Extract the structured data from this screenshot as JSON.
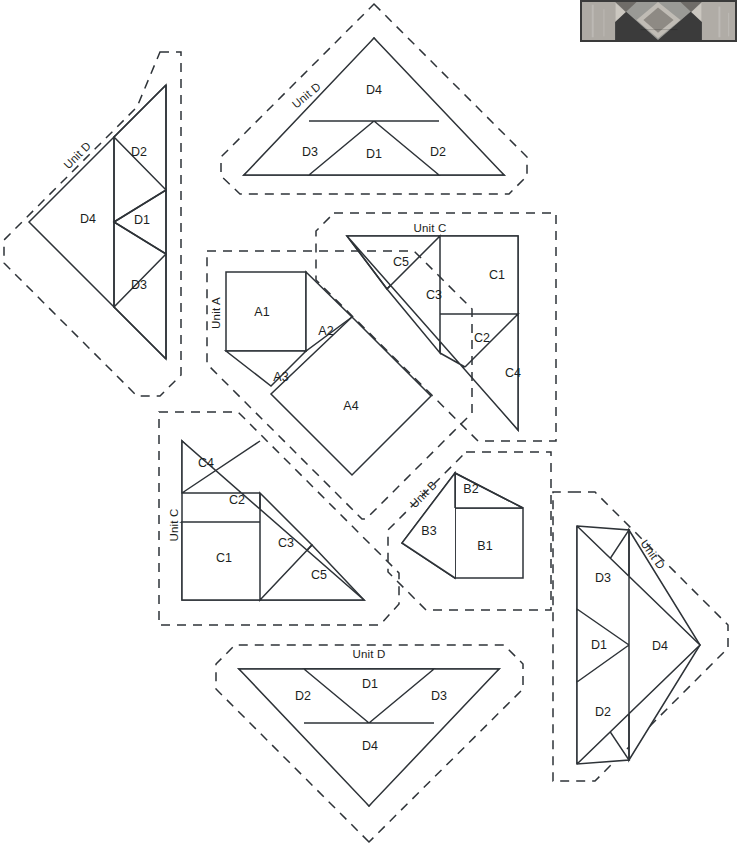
{
  "document": {
    "kind": "quilt-block-cutting-diagram",
    "background_color": "#ffffff",
    "line_color": "#2e3338",
    "cutline_style": "dashed"
  },
  "photo": {
    "alt_name": "finished-block-photograph",
    "caption": ""
  },
  "units": [
    {
      "id": "unit-d-left",
      "label": "Unit D",
      "orientation": "points-left",
      "pieces": [
        {
          "id": "D4",
          "label": "D4",
          "shape": "triangle",
          "x": 88,
          "y": 220
        },
        {
          "id": "D2",
          "label": "D2",
          "shape": "triangle",
          "x": 137,
          "y": 153
        },
        {
          "id": "D1",
          "label": "D1",
          "shape": "triangle",
          "x": 142,
          "y": 220
        },
        {
          "id": "D3",
          "label": "D3",
          "shape": "triangle",
          "x": 137,
          "y": 285
        }
      ]
    },
    {
      "id": "unit-d-top",
      "label": "Unit D",
      "orientation": "points-up",
      "pieces": [
        {
          "id": "D4",
          "label": "D4",
          "shape": "triangle",
          "x": 374,
          "y": 90
        },
        {
          "id": "D3",
          "label": "D3",
          "shape": "triangle",
          "x": 311,
          "y": 152
        },
        {
          "id": "D1",
          "label": "D1",
          "shape": "triangle",
          "x": 374,
          "y": 154
        },
        {
          "id": "D2",
          "label": "D2",
          "shape": "triangle",
          "x": 438,
          "y": 152
        }
      ]
    },
    {
      "id": "unit-c-top",
      "label": "Unit C",
      "orientation": "upper-right",
      "pieces": [
        {
          "id": "C5",
          "label": "C5",
          "shape": "triangle",
          "x": 401,
          "y": 263
        },
        {
          "id": "C3",
          "label": "C3",
          "shape": "triangle",
          "x": 434,
          "y": 296
        },
        {
          "id": "C1",
          "label": "C1",
          "shape": "square",
          "x": 497,
          "y": 275
        },
        {
          "id": "C2",
          "label": "C2",
          "shape": "triangle",
          "x": 482,
          "y": 338
        },
        {
          "id": "C4",
          "label": "C4",
          "shape": "triangle",
          "x": 513,
          "y": 373
        }
      ]
    },
    {
      "id": "unit-a",
      "label": "Unit A",
      "orientation": "center",
      "pieces": [
        {
          "id": "A1",
          "label": "A1",
          "shape": "square",
          "x": 262,
          "y": 313
        },
        {
          "id": "A2",
          "label": "A2",
          "shape": "triangle",
          "x": 325,
          "y": 332
        },
        {
          "id": "A3",
          "label": "A3",
          "shape": "triangle",
          "x": 281,
          "y": 377
        },
        {
          "id": "A4",
          "label": "A4",
          "shape": "square",
          "x": 351,
          "y": 406
        }
      ]
    },
    {
      "id": "unit-c-bottom",
      "label": "Unit C",
      "orientation": "lower-left",
      "pieces": [
        {
          "id": "C4",
          "label": "C4",
          "shape": "triangle",
          "x": 205,
          "y": 463
        },
        {
          "id": "C2",
          "label": "C2",
          "shape": "triangle",
          "x": 236,
          "y": 500
        },
        {
          "id": "C1",
          "label": "C1",
          "shape": "square",
          "x": 224,
          "y": 558
        },
        {
          "id": "C3",
          "label": "C3",
          "shape": "triangle",
          "x": 285,
          "y": 543
        },
        {
          "id": "C5",
          "label": "C5",
          "shape": "triangle",
          "x": 318,
          "y": 575
        }
      ]
    },
    {
      "id": "unit-b",
      "label": "Unit B",
      "orientation": "points-left",
      "pieces": [
        {
          "id": "B2",
          "label": "B2",
          "shape": "triangle",
          "x": 470,
          "y": 489
        },
        {
          "id": "B3",
          "label": "B3",
          "shape": "triangle",
          "x": 428,
          "y": 531
        },
        {
          "id": "B1",
          "label": "B1",
          "shape": "square",
          "x": 484,
          "y": 546
        }
      ]
    },
    {
      "id": "unit-d-bottom",
      "label": "Unit D",
      "orientation": "points-down",
      "pieces": [
        {
          "id": "D1",
          "label": "D1",
          "shape": "triangle",
          "x": 370,
          "y": 684
        },
        {
          "id": "D2",
          "label": "D2",
          "shape": "triangle",
          "x": 302,
          "y": 696
        },
        {
          "id": "D3",
          "label": "D3",
          "shape": "triangle",
          "x": 438,
          "y": 696
        },
        {
          "id": "D4",
          "label": "D4",
          "shape": "triangle",
          "x": 370,
          "y": 746
        }
      ]
    },
    {
      "id": "unit-d-right",
      "label": "Unit D",
      "orientation": "points-right",
      "pieces": [
        {
          "id": "D3",
          "label": "D3",
          "shape": "triangle",
          "x": 602,
          "y": 578
        },
        {
          "id": "D1",
          "label": "D1",
          "shape": "triangle",
          "x": 598,
          "y": 645
        },
        {
          "id": "D4",
          "label": "D4",
          "shape": "triangle",
          "x": 659,
          "y": 646
        },
        {
          "id": "D2",
          "label": "D2",
          "shape": "triangle",
          "x": 602,
          "y": 712
        }
      ]
    }
  ],
  "unit_labels": [
    {
      "id": "unit-d-left-label",
      "text": "Unit D",
      "x": 78,
      "y": 156,
      "rotate": -45
    },
    {
      "id": "unit-d-top-label",
      "text": "Unit D",
      "x": 307,
      "y": 95,
      "rotate": -38
    },
    {
      "id": "unit-c-top-label",
      "text": "Unit C",
      "x": 430,
      "y": 229,
      "rotate": 0
    },
    {
      "id": "unit-a-label",
      "text": "Unit A",
      "x": 216,
      "y": 313,
      "rotate": -90
    },
    {
      "id": "unit-c-bottom-label",
      "text": "Unit C",
      "x": 174,
      "y": 525,
      "rotate": -90
    },
    {
      "id": "unit-b-label",
      "text": "Unit B",
      "x": 423,
      "y": 494,
      "rotate": -45
    },
    {
      "id": "unit-d-bottom-label",
      "text": "Unit D",
      "x": 369,
      "y": 655,
      "rotate": 0
    },
    {
      "id": "unit-d-right-label",
      "text": "Unit D",
      "x": 650,
      "y": 553,
      "rotate": 55
    }
  ]
}
